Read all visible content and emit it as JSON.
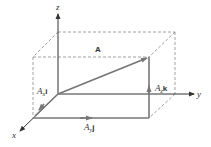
{
  "diagram": {
    "axes": {
      "x_label": "x",
      "y_label": "y",
      "z_label": "z"
    },
    "vector": {
      "label": "A"
    },
    "components": {
      "x": {
        "coef": "A",
        "sub": "x",
        "unit": "i"
      },
      "y": {
        "coef": "A",
        "sub": "y",
        "unit": "j"
      },
      "z": {
        "coef": "A",
        "sub": "z",
        "unit": "k"
      }
    },
    "colors": {
      "vector": "#777777",
      "axes": "#333333",
      "dashed": "#888888"
    }
  }
}
